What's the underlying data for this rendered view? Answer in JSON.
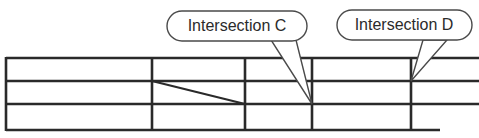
{
  "diagram": {
    "background_color": "#ffffff",
    "line_color": "#2a2a2a",
    "callout_stroke_color": "#4a4a4a",
    "callout_fill_color": "#ffffff",
    "text_color": "#2b2b2b"
  },
  "callouts": [
    {
      "id": "callout-c",
      "label": "Intersection C",
      "bubble": {
        "x": 167,
        "y": 11,
        "width": 140,
        "height": 30,
        "rx": 15
      },
      "text_anchor": {
        "x": 237,
        "y": 27
      },
      "tail_points": "271,40 296,40 312,104",
      "target_point": {
        "x": 312,
        "y": 104
      }
    },
    {
      "id": "callout-d",
      "label": "Intersection D",
      "bubble": {
        "x": 337,
        "y": 10,
        "width": 135,
        "height": 30,
        "rx": 15
      },
      "text_anchor": {
        "x": 404,
        "y": 26
      },
      "tail_points": "423,40 447,40 411,81",
      "target_point": {
        "x": 411,
        "y": 81
      }
    }
  ],
  "grid": {
    "horizontal_lines": [
      {
        "id": "h1",
        "x1": 6,
        "y1": 58,
        "x2": 479,
        "y2": 58
      },
      {
        "id": "h2",
        "x1": 6,
        "y1": 81,
        "x2": 479,
        "y2": 81
      },
      {
        "id": "h3",
        "x1": 6,
        "y1": 104,
        "x2": 479,
        "y2": 104
      },
      {
        "id": "h4",
        "x1": 6,
        "y1": 130,
        "x2": 440,
        "y2": 130
      }
    ],
    "vertical_lines": [
      {
        "id": "v1",
        "x1": 6,
        "y1": 58,
        "x2": 6,
        "y2": 130
      },
      {
        "id": "v2",
        "x1": 152,
        "y1": 58,
        "x2": 152,
        "y2": 130
      },
      {
        "id": "v3",
        "x1": 245,
        "y1": 58,
        "x2": 245,
        "y2": 130
      },
      {
        "id": "v4",
        "x1": 312,
        "y1": 58,
        "x2": 312,
        "y2": 130
      },
      {
        "id": "v5",
        "x1": 411,
        "y1": 58,
        "x2": 411,
        "y2": 130
      }
    ],
    "diagonal_lines": [
      {
        "id": "d1",
        "x1": 152,
        "y1": 81,
        "x2": 245,
        "y2": 104
      }
    ]
  }
}
